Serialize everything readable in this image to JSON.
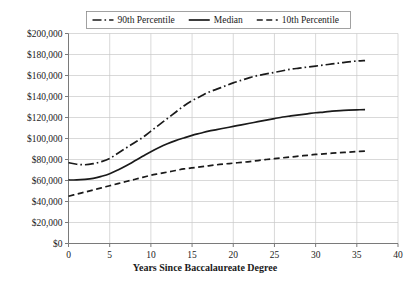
{
  "chart_data": {
    "type": "line",
    "title": "",
    "xlabel": "Years Since Baccalaureate Degree",
    "ylabel": "",
    "xlim": [
      0,
      40
    ],
    "ylim": [
      0,
      200000
    ],
    "grid": true,
    "legend_position": "top",
    "x_tick_labels": [
      "0",
      "5",
      "10",
      "15",
      "20",
      "25",
      "30",
      "35",
      "40"
    ],
    "x_ticks": [
      0,
      5,
      10,
      15,
      20,
      25,
      30,
      35,
      40
    ],
    "y_tick_labels": [
      "$0",
      "$20,000",
      "$40,000",
      "$60,000",
      "$80,000",
      "$100,000",
      "$120,000",
      "$140,000",
      "$160,000",
      "$180,000",
      "$200,000"
    ],
    "y_ticks": [
      0,
      20000,
      40000,
      60000,
      80000,
      100000,
      120000,
      140000,
      160000,
      180000,
      200000
    ],
    "x": [
      0,
      1,
      2,
      3,
      4,
      5,
      6,
      7,
      8,
      9,
      10,
      11,
      12,
      13,
      14,
      15,
      16,
      17,
      18,
      19,
      20,
      21,
      22,
      23,
      24,
      25,
      26,
      27,
      28,
      29,
      30,
      31,
      32,
      33,
      34,
      35,
      36
    ],
    "series": [
      {
        "name": "90th Percentile",
        "style": "dash-dot",
        "color": "#1a1a1a",
        "values": [
          77000,
          75500,
          75000,
          76000,
          78000,
          81000,
          86000,
          91000,
          96000,
          101000,
          107000,
          113000,
          119000,
          125000,
          131000,
          136000,
          140000,
          144000,
          147000,
          150000,
          153000,
          155500,
          158000,
          160000,
          161500,
          163000,
          164500,
          166000,
          167000,
          168000,
          169000,
          170000,
          171000,
          172000,
          173000,
          173800,
          174200
        ]
      },
      {
        "name": "Median",
        "style": "solid",
        "color": "#1a1a1a",
        "values": [
          60500,
          60500,
          61000,
          62000,
          64000,
          66500,
          70000,
          74000,
          78500,
          83000,
          87500,
          91500,
          95000,
          98000,
          100500,
          103000,
          105000,
          107000,
          108500,
          110000,
          111500,
          113000,
          114500,
          116000,
          117500,
          119000,
          120500,
          121500,
          122500,
          123500,
          124500,
          125200,
          126000,
          126600,
          127000,
          127300,
          127500
        ]
      },
      {
        "name": "10th Percentile",
        "style": "dashed",
        "color": "#1a1a1a",
        "values": [
          45000,
          47000,
          49000,
          51000,
          53000,
          55000,
          57000,
          59000,
          61000,
          63000,
          65000,
          66500,
          68000,
          69500,
          71000,
          72000,
          73000,
          74000,
          75000,
          75800,
          76500,
          77300,
          78000,
          79000,
          80000,
          80800,
          81600,
          82400,
          83200,
          84000,
          84800,
          85400,
          86000,
          86500,
          87000,
          87500,
          88000
        ]
      }
    ]
  },
  "legend": {
    "items": [
      {
        "label": "90th Percentile"
      },
      {
        "label": "Median"
      },
      {
        "label": "10th Percentile"
      }
    ]
  }
}
